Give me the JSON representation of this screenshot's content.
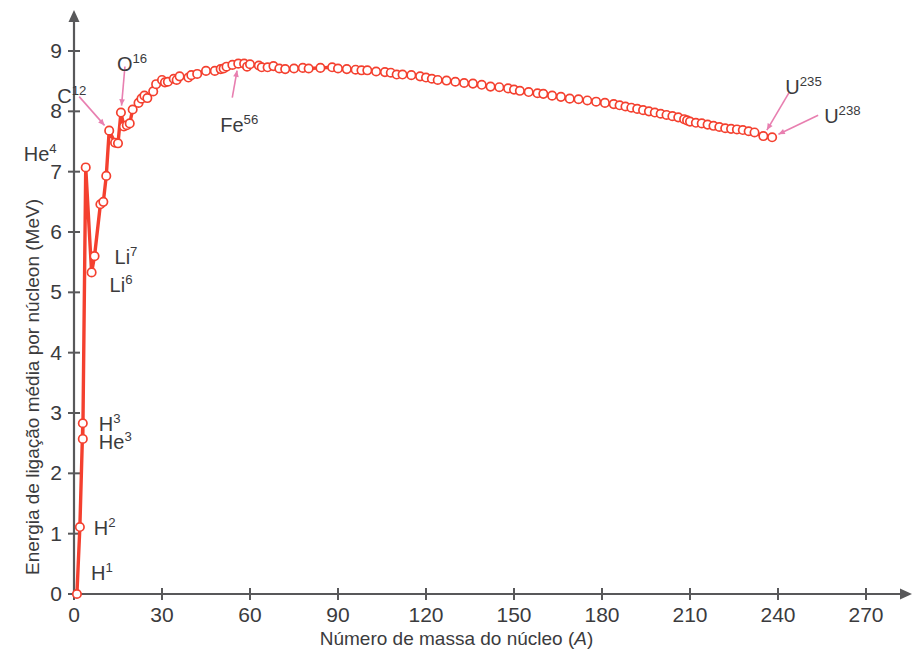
{
  "chart_data": {
    "type": "line",
    "title": "",
    "xlabel": "Número de massa do núcleo (A)",
    "ylabel": "Energia de ligação média por núcleon (MeV)",
    "xlim": [
      0,
      278
    ],
    "ylim": [
      0,
      9.4
    ],
    "xticks": [
      0,
      30,
      60,
      90,
      120,
      150,
      180,
      210,
      240,
      270
    ],
    "yticks": [
      0,
      1,
      2,
      3,
      4,
      5,
      6,
      7,
      8,
      9
    ],
    "grid": false,
    "legend": "none",
    "series_name": "Energia de ligação média por núcleon",
    "marker": "open-circle",
    "line_color": "#f4402f",
    "marker_face": "#ffffff",
    "annotation_color": "#e87fb0",
    "axis_color": "#58585a",
    "x": [
      1,
      2,
      3,
      3,
      4,
      6,
      7,
      9,
      10,
      11,
      12,
      14,
      15,
      16,
      17,
      18,
      19,
      20,
      22,
      23,
      24,
      25,
      27,
      28,
      30,
      31,
      32,
      34,
      35,
      36,
      39,
      40,
      42,
      45,
      48,
      50,
      51,
      52,
      54,
      56,
      58,
      59,
      60,
      63,
      64,
      66,
      68,
      70,
      72,
      75,
      78,
      80,
      84,
      88,
      90,
      93,
      96,
      98,
      100,
      103,
      106,
      108,
      110,
      112,
      115,
      118,
      120,
      122,
      124,
      127,
      130,
      133,
      136,
      139,
      142,
      145,
      148,
      150,
      152,
      155,
      158,
      160,
      163,
      166,
      169,
      172,
      175,
      178,
      181,
      184,
      186,
      188,
      190,
      192,
      194,
      196,
      198,
      200,
      202,
      204,
      206,
      208,
      209,
      210,
      212,
      214,
      216,
      218,
      220,
      222,
      224,
      226,
      228,
      230,
      232,
      235,
      238
    ],
    "y": [
      0.0,
      1.11,
      2.83,
      2.57,
      7.07,
      5.33,
      5.6,
      6.46,
      6.5,
      6.93,
      7.68,
      7.48,
      7.47,
      7.98,
      7.75,
      7.77,
      7.8,
      8.03,
      8.14,
      8.21,
      8.26,
      8.22,
      8.33,
      8.45,
      8.52,
      8.48,
      8.49,
      8.54,
      8.52,
      8.58,
      8.56,
      8.6,
      8.62,
      8.67,
      8.67,
      8.7,
      8.71,
      8.74,
      8.77,
      8.79,
      8.79,
      8.74,
      8.78,
      8.76,
      8.73,
      8.73,
      8.75,
      8.71,
      8.7,
      8.71,
      8.72,
      8.71,
      8.72,
      8.73,
      8.71,
      8.7,
      8.69,
      8.68,
      8.68,
      8.66,
      8.65,
      8.64,
      8.61,
      8.61,
      8.6,
      8.58,
      8.56,
      8.54,
      8.52,
      8.51,
      8.49,
      8.47,
      8.46,
      8.44,
      8.41,
      8.4,
      8.38,
      8.36,
      8.34,
      8.32,
      8.3,
      8.29,
      8.26,
      8.24,
      8.21,
      8.2,
      8.18,
      8.16,
      8.14,
      8.12,
      8.1,
      8.08,
      8.06,
      8.04,
      8.02,
      8.0,
      7.98,
      7.96,
      7.94,
      7.92,
      7.9,
      7.87,
      7.85,
      7.83,
      7.81,
      7.8,
      7.78,
      7.76,
      7.74,
      7.72,
      7.71,
      7.7,
      7.69,
      7.67,
      7.65,
      7.59,
      7.57
    ],
    "annotations": [
      {
        "label": "H",
        "sup": "1",
        "A": 1,
        "E": 0.0
      },
      {
        "label": "H",
        "sup": "2",
        "A": 2,
        "E": 1.11
      },
      {
        "label": "H",
        "sup": "3",
        "A": 3,
        "E": 2.83
      },
      {
        "label": "He",
        "sup": "3",
        "A": 3,
        "E": 2.57
      },
      {
        "label": "He",
        "sup": "4",
        "A": 4,
        "E": 7.07
      },
      {
        "label": "Li",
        "sup": "6",
        "A": 6,
        "E": 5.33
      },
      {
        "label": "Li",
        "sup": "7",
        "A": 7,
        "E": 5.6
      },
      {
        "label": "C",
        "sup": "12",
        "A": 12,
        "E": 7.68
      },
      {
        "label": "O",
        "sup": "16",
        "A": 16,
        "E": 7.98
      },
      {
        "label": "Fe",
        "sup": "56",
        "A": 56,
        "E": 8.79
      },
      {
        "label": "U",
        "sup": "235",
        "A": 235,
        "E": 7.59
      },
      {
        "label": "U",
        "sup": "238",
        "A": 238,
        "E": 7.57
      }
    ]
  },
  "axes": {
    "x_tick_labels": [
      "0",
      "30",
      "60",
      "90",
      "120",
      "150",
      "180",
      "210",
      "240",
      "270"
    ],
    "y_tick_labels": [
      "0",
      "1",
      "2",
      "3",
      "4",
      "5",
      "6",
      "7",
      "8",
      "9"
    ],
    "x_title_main": "Número de massa do núcleo (",
    "x_title_italic": "A",
    "x_title_close": ")",
    "y_title": "Energia de ligação média por núcleon (MeV)"
  }
}
